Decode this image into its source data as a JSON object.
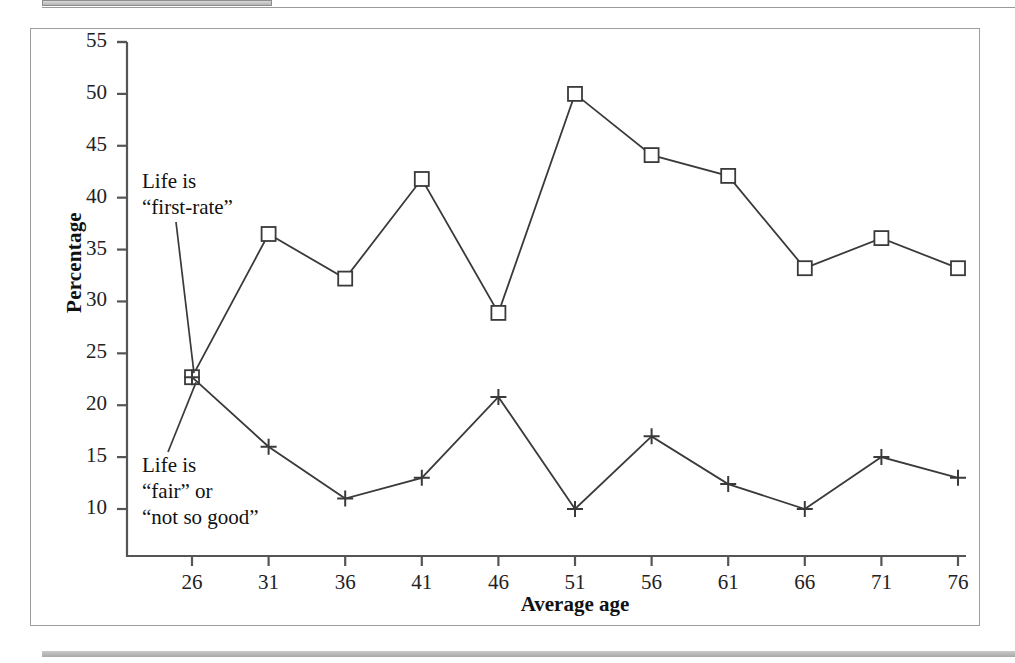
{
  "figure": {
    "x_axis_title": "Average age",
    "y_axis_title": "Percentage"
  },
  "annotations": {
    "upper": "Life is\n“first-rate”",
    "lower": "Life is\n“fair” or\n“not so good”"
  },
  "axis": {
    "y_ticks": [
      "55",
      "50",
      "45",
      "40",
      "35",
      "30",
      "25",
      "20",
      "15",
      "10"
    ],
    "x_ticks": [
      "26",
      "31",
      "36",
      "41",
      "46",
      "51",
      "56",
      "61",
      "66",
      "71",
      "76"
    ]
  },
  "colors": {
    "line": "#3a3a3a",
    "axis": "#555555",
    "frame": "#9d9d9d",
    "text": "#111111",
    "rule": "#b4b4b4"
  },
  "chart_data": {
    "type": "line",
    "title": "",
    "xlabel": "Average age",
    "ylabel": "Percentage",
    "xlim": [
      23.5,
      78.5
    ],
    "ylim": [
      6.5,
      56.5
    ],
    "grid": false,
    "legend": "annotated-inline",
    "x": [
      26,
      31,
      36,
      41,
      46,
      51,
      56,
      61,
      66,
      71,
      76
    ],
    "series": [
      {
        "name": "Life is “first-rate”",
        "marker": "square",
        "values": [
          22.7,
          36.5,
          32.2,
          41.8,
          28.9,
          50.0,
          44.1,
          42.1,
          33.2,
          36.1,
          33.2
        ]
      },
      {
        "name": "Life is “fair” or “not so good”",
        "marker": "plus",
        "values": [
          22.7,
          16.0,
          11.0,
          13.0,
          20.8,
          10.0,
          17.0,
          12.4,
          10.0,
          15.0,
          13.0
        ]
      }
    ]
  }
}
